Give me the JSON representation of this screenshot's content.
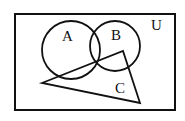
{
  "diagram": {
    "type": "venn",
    "universe": {
      "label": "U",
      "x": 15,
      "y": 14,
      "width": 160,
      "height": 96
    },
    "sets": [
      {
        "label": "A",
        "shape": "circle",
        "cx": 71,
        "cy": 50,
        "r": 29,
        "label_x": 62,
        "label_y": 41
      },
      {
        "label": "B",
        "shape": "circle",
        "cx": 115,
        "cy": 46,
        "r": 25,
        "label_x": 111,
        "label_y": 40
      },
      {
        "label": "C",
        "shape": "triangle",
        "points": "42,83 123,51 140,103",
        "label_x": 115,
        "label_y": 93
      }
    ],
    "universe_label_x": 151,
    "universe_label_y": 30,
    "stroke_color": "#111111"
  }
}
